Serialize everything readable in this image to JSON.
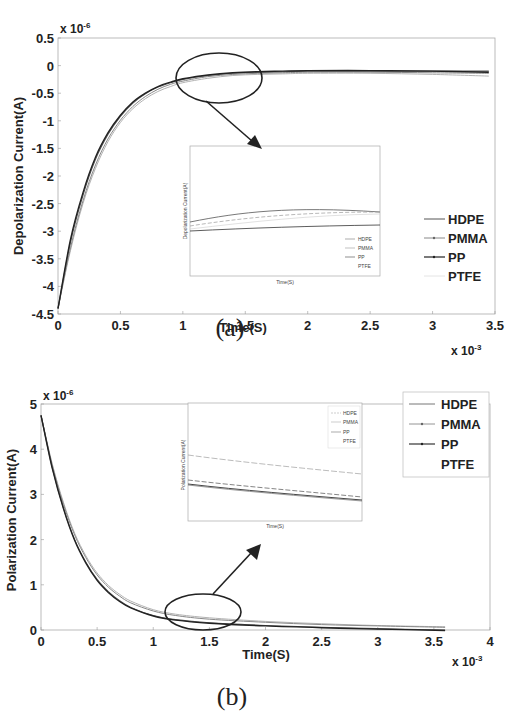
{
  "chart_data": [
    {
      "panel": "(a)",
      "type": "line",
      "title": "",
      "xlabel": "Time(S)",
      "ylabel": "Depolarization Current(A)",
      "x_multiplier": "x 10^-3",
      "y_multiplier": "x 10^-6",
      "xlim": [
        0,
        3.5
      ],
      "ylim": [
        -4.5,
        0.5
      ],
      "xticks": [
        "0",
        "0.5",
        "1",
        "1.5",
        "2",
        "2.5",
        "3",
        "3.5"
      ],
      "yticks": [
        "0.5",
        "0",
        "-0.5",
        "-1",
        "-1.5",
        "-2",
        "-2.5",
        "-3",
        "-3.5",
        "-4",
        "-4.5"
      ],
      "grid": false,
      "legend_position": "right-middle",
      "x": [
        0,
        0.1,
        0.2,
        0.3,
        0.4,
        0.5,
        0.6,
        0.7,
        0.8,
        0.9,
        1.0,
        1.2,
        1.4,
        1.6,
        1.8,
        2.0,
        2.5,
        3.0,
        3.45
      ],
      "series": [
        {
          "name": "HDPE",
          "values": [
            -4.4,
            -3.2,
            -2.35,
            -1.7,
            -1.25,
            -0.92,
            -0.68,
            -0.51,
            -0.39,
            -0.31,
            -0.25,
            -0.18,
            -0.14,
            -0.12,
            -0.11,
            -0.1,
            -0.1,
            -0.1,
            -0.1
          ]
        },
        {
          "name": "PMMA",
          "values": [
            -4.4,
            -3.3,
            -2.45,
            -1.8,
            -1.33,
            -0.99,
            -0.74,
            -0.56,
            -0.43,
            -0.34,
            -0.28,
            -0.2,
            -0.16,
            -0.14,
            -0.13,
            -0.12,
            -0.12,
            -0.13,
            -0.14
          ]
        },
        {
          "name": "PP",
          "values": [
            -4.4,
            -3.15,
            -2.3,
            -1.66,
            -1.22,
            -0.9,
            -0.66,
            -0.5,
            -0.38,
            -0.3,
            -0.24,
            -0.17,
            -0.13,
            -0.11,
            -0.1,
            -0.09,
            -0.09,
            -0.1,
            -0.12
          ]
        },
        {
          "name": "PTFE",
          "values": [
            -4.4,
            -3.35,
            -2.5,
            -1.86,
            -1.38,
            -1.03,
            -0.78,
            -0.6,
            -0.47,
            -0.38,
            -0.31,
            -0.23,
            -0.18,
            -0.16,
            -0.15,
            -0.14,
            -0.14,
            -0.16,
            -0.19
          ]
        }
      ],
      "annotations": [
        "ellipse highlighting curves near t=1.0-1.8 x10^-3 s",
        "arrow pointing to zoomed inset"
      ],
      "inset": {
        "xlabel": "Time(S)",
        "ylabel": "Depolarization Current(A)",
        "legend": [
          "HDPE",
          "PMMA",
          "PP",
          "PTFE"
        ]
      }
    },
    {
      "panel": "(b)",
      "type": "line",
      "title": "",
      "xlabel": "Time(S)",
      "ylabel": "Polarization Current(A)",
      "x_multiplier": "x 10^-3",
      "y_multiplier": "x 10^-6",
      "xlim": [
        0,
        4
      ],
      "ylim": [
        0,
        5
      ],
      "xticks": [
        "0",
        "0.5",
        "1",
        "1.5",
        "2",
        "2.5",
        "3",
        "3.5",
        "4"
      ],
      "yticks": [
        "5",
        "4",
        "3",
        "2",
        "1",
        "0"
      ],
      "grid": false,
      "legend_position": "upper-right",
      "x": [
        0,
        0.1,
        0.2,
        0.3,
        0.4,
        0.5,
        0.6,
        0.7,
        0.8,
        1.0,
        1.2,
        1.5,
        2.0,
        2.5,
        3.0,
        3.6
      ],
      "series": [
        {
          "name": "HDPE",
          "values": [
            4.75,
            3.6,
            2.7,
            2.0,
            1.5,
            1.12,
            0.85,
            0.65,
            0.5,
            0.32,
            0.23,
            0.16,
            0.1,
            0.06,
            0.03,
            0.0
          ]
        },
        {
          "name": "PMMA",
          "values": [
            4.75,
            3.65,
            2.78,
            2.1,
            1.6,
            1.22,
            0.95,
            0.75,
            0.6,
            0.42,
            0.32,
            0.24,
            0.17,
            0.12,
            0.09,
            0.06
          ]
        },
        {
          "name": "PP",
          "values": [
            4.75,
            3.58,
            2.68,
            1.98,
            1.48,
            1.1,
            0.83,
            0.63,
            0.49,
            0.31,
            0.22,
            0.15,
            0.09,
            0.05,
            0.02,
            -0.01
          ]
        },
        {
          "name": "PTFE",
          "values": [
            4.75,
            3.68,
            2.82,
            2.14,
            1.64,
            1.26,
            0.99,
            0.79,
            0.64,
            0.45,
            0.35,
            0.27,
            0.19,
            0.14,
            0.1,
            0.07
          ]
        }
      ],
      "annotations": [
        "ellipse highlighting curves near t=1.1-1.7 x10^-3 s",
        "arrow pointing to zoomed inset"
      ],
      "inset": {
        "xlabel": "Time(S)",
        "ylabel": "Polarization Current(A)",
        "legend": [
          "HDPE",
          "PMMA",
          "PP",
          "PTFE"
        ]
      }
    }
  ],
  "captions": {
    "a": "(a)",
    "b": "(b)"
  },
  "multipliers": {
    "y_base": "x 10",
    "y_exp": "-6",
    "x_base": "x 10",
    "x_exp": "-3"
  },
  "labels": {
    "a_xlabel": "Time(S)",
    "a_ylabel": "Depolarization Current(A)",
    "b_xlabel": "Time(S)",
    "b_ylabel": "Polarization Current(A)",
    "inset_a_ylabel": "Depolarization Current(A)",
    "inset_b_ylabel": "Polarization Current(A)",
    "inset_xlabel": "Time(S)"
  },
  "legend": [
    "HDPE",
    "PMMA",
    "PP",
    "PTFE"
  ],
  "colors": {
    "HDPE": "#555555",
    "PMMA": "#888888",
    "PP": "#222222",
    "PTFE": "#bbbbbb",
    "axis": "#999999",
    "annotation": "#222222"
  }
}
